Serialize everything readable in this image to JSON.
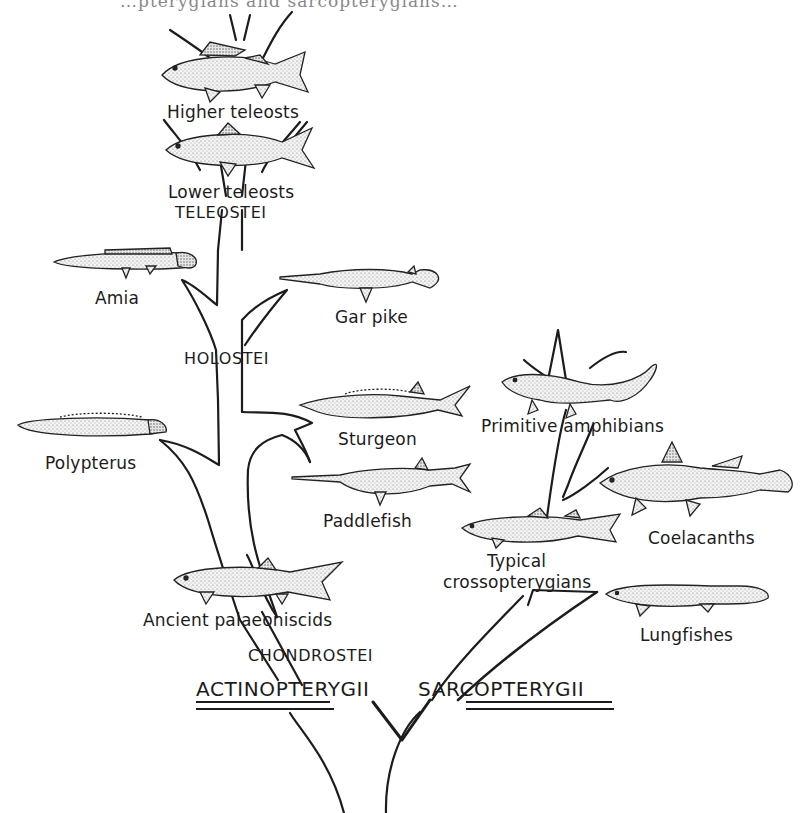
{
  "figure": {
    "type": "phylogenetic-tree",
    "clipped_top_text": "…pterygians and sarcopterygians…",
    "colors": {
      "ink": "#1c1c1c",
      "paper": "#ffffff",
      "stipple": "#6b6b6b"
    }
  },
  "major_groups": {
    "actinopterygii": "ACTINOPTERYGII",
    "sarcopterygii": "SARCOPTERYGII"
  },
  "subgroups": {
    "teleostei": "TELEOSTEI",
    "holostei": "HOLOSTEI",
    "chondrostei": "CHONDROSTEI"
  },
  "taxa": {
    "higher_teleosts": "Higher teleosts",
    "lower_teleosts": "Lower teleosts",
    "amia": "Amia",
    "gar_pike": "Gar pike",
    "polypterus": "Polypterus",
    "sturgeon": "Sturgeon",
    "paddlefish": "Paddlefish",
    "ancient_palaeoniscids": "Ancient palaeoniscids",
    "primitive_amphibians": "Primitive amphibians",
    "coelacanths": "Coelacanths",
    "typical_crossopterygians_1": "Typical",
    "typical_crossopterygians_2": "crossopterygians",
    "lungfishes": "Lungfishes"
  }
}
